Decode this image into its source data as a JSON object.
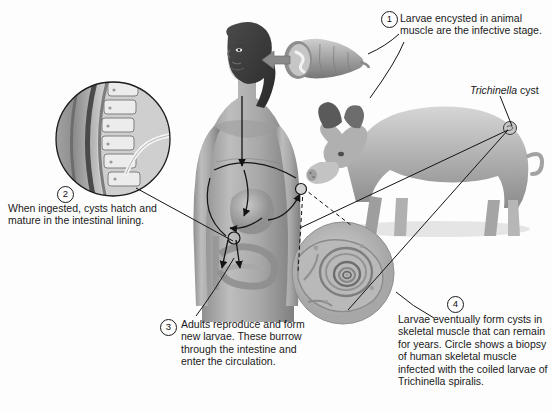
{
  "figure": {
    "title_implicit": "Life cycle of Trichinella spiralis",
    "background": "#fdfdfd",
    "ink": "#1a1a1a"
  },
  "labels": {
    "cyst_genus": "Trichinella",
    "cyst_word": " cyst"
  },
  "steps": [
    {
      "number": "1",
      "text": "Larvae encysted in animal muscle are the infective stage."
    },
    {
      "number": "2",
      "text": "When ingested, cysts hatch and mature in the intestinal lining."
    },
    {
      "number": "3",
      "text": "Adults reproduce and form new larvae. These burrow through the intestine and enter the circulation."
    },
    {
      "number": "4",
      "text": "Larvae eventually form cysts in skeletal muscle that can remain for years. Circle shows a biopsy of human skeletal muscle infected with the coiled larvae of Trichinella spiralis."
    }
  ],
  "artwork": [
    {
      "name": "encysted-larva-illustration",
      "caption_ref": "1"
    },
    {
      "name": "pig-illustration",
      "caption_ref": "1"
    },
    {
      "name": "intestinal-villi-inset",
      "caption_ref": "2"
    },
    {
      "name": "woman-torso-illustration",
      "caption_ref": "3"
    },
    {
      "name": "muscle-biopsy-micrograph",
      "caption_ref": "4"
    }
  ]
}
